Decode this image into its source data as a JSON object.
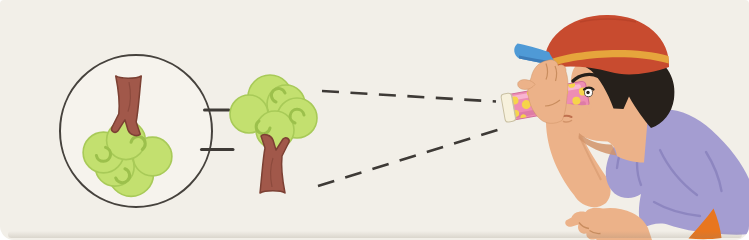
{
  "scene": {
    "description": "A boy wearing a striped cap looks at a small tree through a polka-dot toy telescope; two dashed sight rays run from the tree to the telescope lens, and a circled inset shows the enlarged, upside-down image of the tree seen through the telescope.",
    "background_color": "#f2efe8",
    "outline_color": "#3e3a36"
  },
  "inset": {
    "role": "magnified inverted image of the tree as seen through the telescope",
    "fill": "#f6f3ed",
    "stroke": "#46423d"
  },
  "link_dashes": {
    "count": 2,
    "color": "#3e3a36"
  },
  "sight_rays": {
    "count": 2,
    "style": "dashed",
    "color": "#3e3a36"
  },
  "tree": {
    "foliage": "#c3e06f",
    "foliage_outline": "#a8ca58",
    "curl": "#9cc04c",
    "trunk": "#a1584a",
    "trunk_outline": "#7c4033"
  },
  "telescope": {
    "tube": "#ee8db3",
    "tube_shadow": "#d16f9b",
    "highlight": "#f8b9d3",
    "dots": "#f6d44b",
    "front_cap": "#f7f1dc",
    "front_cap_edge": "#c9c0a2"
  },
  "boy": {
    "cap": "#c84b2f",
    "cap_seam": "#b03d27",
    "cap_stripe": "#e6a53c",
    "cap_brim": "#4f9ad6",
    "cap_brim_dark": "#3d7cb8",
    "hair": "#26201b",
    "skin": "#ecb289",
    "skin_shadow": "#d2946a",
    "skin_line": "#c98d5f",
    "mouth": "#c0714f",
    "shirt": "#a49dd1",
    "shirt_fold": "#8a83be",
    "collar": "#968fc8",
    "shorts": "#e8761f"
  }
}
